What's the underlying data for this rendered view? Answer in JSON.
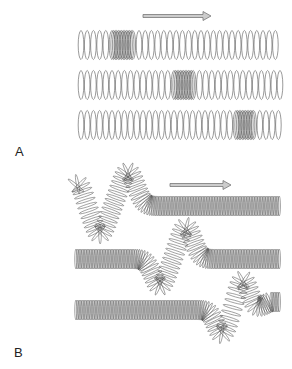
{
  "figure": {
    "panels": [
      {
        "label": "A",
        "type": "longitudinal",
        "arrow_direction": "right",
        "rows": [
          {
            "compression_x": 122
          },
          {
            "compression_x": 182
          },
          {
            "compression_x": 242
          }
        ]
      },
      {
        "label": "B",
        "type": "transverse",
        "arrow_direction": "right",
        "rows": [
          {
            "pulse_x": 100
          },
          {
            "pulse_x": 175
          },
          {
            "pulse_x": 245
          }
        ]
      }
    ],
    "colors": {
      "coil": "#555555",
      "arrow_fill": "#cccccc",
      "arrow_stroke": "#777777"
    }
  }
}
